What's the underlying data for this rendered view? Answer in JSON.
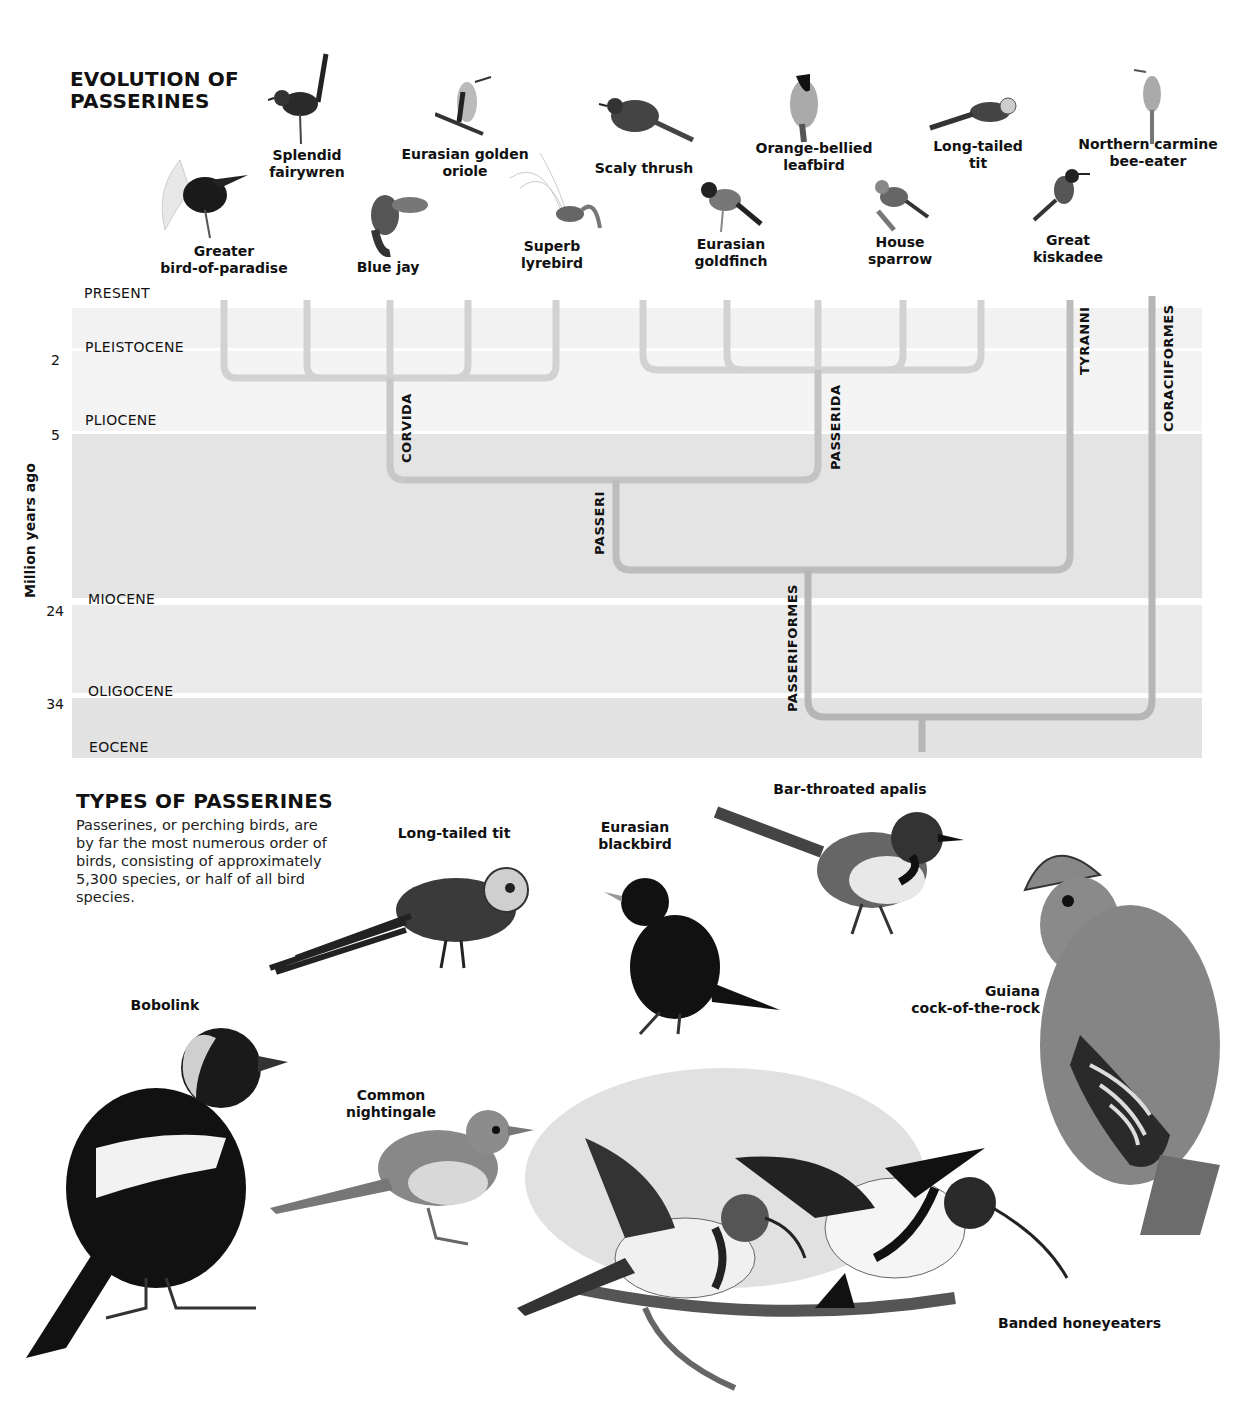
{
  "evolution": {
    "title_line1": "EVOLUTION OF",
    "title_line2": "PASSERINES",
    "y_axis_label": "Million years ago",
    "epochs": [
      {
        "name": "PRESENT"
      },
      {
        "name": "PLEISTOCENE"
      },
      {
        "name": "PLIOCENE"
      },
      {
        "name": "MIOCENE"
      },
      {
        "name": "OLIGOCENE"
      },
      {
        "name": "EOCENE"
      }
    ],
    "ticks": [
      "2",
      "5",
      "24",
      "34"
    ],
    "clades": {
      "corvida": "CORVIDA",
      "passerida": "PASSERIDA",
      "passeri": "PASSERI",
      "passeriformes": "PASSERIFORMES",
      "tyranni": "TYRANNI",
      "coraciiformes": "CORACIIFORMES"
    },
    "birds": [
      {
        "line1": "Greater",
        "line2": "bird-of-paradise"
      },
      {
        "line1": "Splendid",
        "line2": "fairywren"
      },
      {
        "line1": "Blue jay",
        "line2": ""
      },
      {
        "line1": "Eurasian golden",
        "line2": "oriole"
      },
      {
        "line1": "Superb",
        "line2": "lyrebird"
      },
      {
        "line1": "Scaly thrush",
        "line2": ""
      },
      {
        "line1": "Eurasian",
        "line2": "goldfinch"
      },
      {
        "line1": "Orange-bellied",
        "line2": "leafbird"
      },
      {
        "line1": "House",
        "line2": "sparrow"
      },
      {
        "line1": "Long-tailed",
        "line2": "tit"
      },
      {
        "line1": "Great",
        "line2": "kiskadee"
      },
      {
        "line1": "Northern carmine",
        "line2": "bee-eater"
      }
    ],
    "colors": {
      "band_light": "#f2f2f2",
      "band_dark": "#e3e3e3",
      "branch_light": "#d0d0d0",
      "branch_dark": "#b4b4b4"
    }
  },
  "types": {
    "title": "TYPES OF PASSERINES",
    "description": "Passerines, or perching birds, are by far the most numerous order of birds, consisting of approximately 5,300 species, or half of all bird species.",
    "birds": [
      {
        "line1": "Long-tailed tit",
        "line2": ""
      },
      {
        "line1": "Eurasian",
        "line2": "blackbird"
      },
      {
        "line1": "Bar-throated apalis",
        "line2": ""
      },
      {
        "line1": "Bobolink",
        "line2": ""
      },
      {
        "line1": "Guiana",
        "line2": "cock-of-the-rock"
      },
      {
        "line1": "Common",
        "line2": "nightingale"
      },
      {
        "line1": "Banded honeyeaters",
        "line2": ""
      }
    ]
  }
}
